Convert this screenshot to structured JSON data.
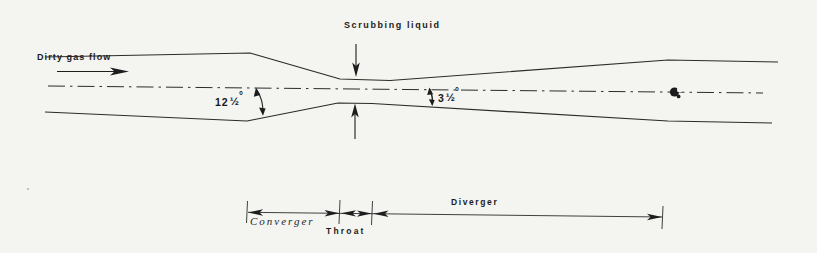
{
  "figure": {
    "labels": {
      "dirty_gas_flow": "Dirty gas flow",
      "scrubbing_liquid": "Scrubbing liquid"
    },
    "angles": {
      "converger": {
        "whole": "12",
        "fraction": "½",
        "degree": "°"
      },
      "diverger": {
        "whole": "3",
        "fraction": "½",
        "degree": "°"
      }
    },
    "sections": {
      "converger": "Converger",
      "throat": "Throat",
      "diverger": "Diverger"
    },
    "colors": {
      "paper": "#f4f4f1",
      "ink": "#2b2b2b"
    }
  }
}
